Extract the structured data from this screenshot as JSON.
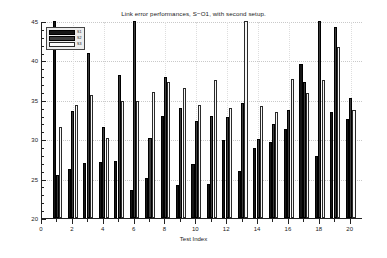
{
  "chart_data": {
    "type": "bar",
    "title": "Link error performances, S−O1, with second setup.",
    "xlabel": "Test Index",
    "ylabel": "Error Vector Magnitude (%)",
    "xlim": [
      0,
      20.8
    ],
    "ylim": [
      20,
      45
    ],
    "grid": true,
    "legend_position": "upper-left",
    "x_ticks": [
      0,
      2,
      4,
      6,
      8,
      10,
      12,
      14,
      16,
      18,
      20
    ],
    "y_ticks": [
      20,
      25,
      30,
      35,
      40,
      45
    ],
    "categories": [
      1,
      2,
      3,
      4,
      5,
      6,
      7,
      8,
      9,
      10,
      11,
      12,
      13,
      14,
      15,
      16,
      17,
      18,
      19,
      20
    ],
    "series": [
      {
        "name": "S1",
        "color": "#161616",
        "values": [
          45.0,
          26.2,
          27.0,
          27.1,
          27.2,
          23.5,
          25.1,
          33.0,
          24.2,
          26.8,
          24.3,
          29.9,
          26.0,
          28.9,
          29.6,
          31.3,
          39.6,
          27.9,
          33.4,
          32.6
        ]
      },
      {
        "name": "S2",
        "color": "#3c3c3c",
        "values": [
          25.4,
          33.6,
          40.9,
          31.6,
          38.2,
          45.0,
          30.2,
          37.9,
          34.0,
          32.3,
          32.9,
          32.8,
          34.6,
          30.0,
          31.9,
          33.7,
          37.2,
          45.0,
          44.3,
          35.2
        ]
      },
      {
        "name": "S3",
        "color": "#fbfbfb",
        "values": [
          31.6,
          34.4,
          35.6,
          30.2,
          34.9,
          34.9,
          36.0,
          37.2,
          36.5,
          34.3,
          37.5,
          33.9,
          45.0,
          34.2,
          33.5,
          37.6,
          35.9,
          37.5,
          41.7,
          33.7
        ]
      }
    ]
  },
  "legend": {
    "items": [
      {
        "label": "S1"
      },
      {
        "label": "S2"
      },
      {
        "label": "S3"
      }
    ]
  }
}
